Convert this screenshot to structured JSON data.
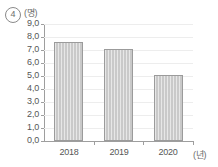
{
  "header": {
    "item_number": "4",
    "y_unit": "(명)",
    "x_unit": "(년)"
  },
  "chart_data": {
    "type": "bar",
    "title": "",
    "xlabel": "(년)",
    "ylabel": "(명)",
    "categories": [
      "2018",
      "2019",
      "2020"
    ],
    "values": [
      7.6,
      7.05,
      5.05
    ],
    "ylim": [
      0.0,
      9.0
    ],
    "ytick_labels": [
      "9,0",
      "8,0",
      "7,0",
      "6,0",
      "5,0",
      "4,0",
      "3,0",
      "2,0",
      "1,0",
      "0,0"
    ],
    "ytick_values": [
      9.0,
      8.0,
      7.0,
      6.0,
      5.0,
      4.0,
      3.0,
      2.0,
      1.0,
      0.0
    ],
    "grid": true,
    "legend": null,
    "bar_color": "#c9c9c9",
    "bar_border_color": "#9b9b9b",
    "gridline_color": "#ededed",
    "axis_color": "#9e9e9e"
  }
}
